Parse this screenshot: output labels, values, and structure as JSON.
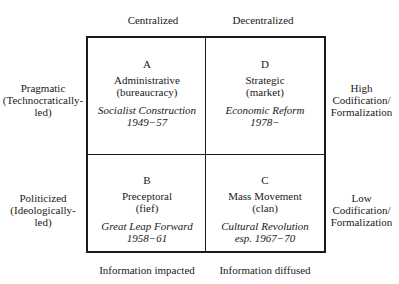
{
  "columns": {
    "top": [
      "Centralized",
      "Decentralized"
    ],
    "bottom": [
      "Information impacted",
      "Information diffused"
    ]
  },
  "rows": {
    "left": [
      [
        "Pragmatic",
        "(Technocratically-",
        "led)"
      ],
      [
        "Politicized",
        "(Ideologically-",
        "led)"
      ]
    ],
    "right": [
      [
        "High",
        "Codification/",
        "Formalization"
      ],
      [
        "Low",
        "Codification/",
        "Formalization"
      ]
    ]
  },
  "cells": {
    "A": {
      "letter": "A",
      "name1": "Administrative",
      "name2": "(bureaucracy)",
      "period1": "Socialist Construction",
      "period2": "1949−57"
    },
    "D": {
      "letter": "D",
      "name1": "Strategic",
      "name2": "(market)",
      "period1": "Economic Reform",
      "period2": "1978−"
    },
    "B": {
      "letter": "B",
      "name1": "Preceptoral",
      "name2": "(fief)",
      "period1": "Great Leap Forward",
      "period2": "1958−61"
    },
    "C": {
      "letter": "C",
      "name1": "Mass Movement",
      "name2": "(clan)",
      "period1": "Cultural Revolution",
      "period2": "esp. 1967−70"
    }
  }
}
